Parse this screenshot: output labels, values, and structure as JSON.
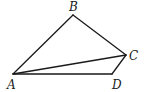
{
  "diagram": {
    "type": "geometry-figure",
    "stroke_color": "#1a1a1a",
    "points": {
      "A": {
        "label": "A",
        "x": 13,
        "y": 74,
        "label_x": 7,
        "label_y": 89
      },
      "B": {
        "label": "B",
        "x": 73,
        "y": 15,
        "label_x": 69,
        "label_y": 11
      },
      "C": {
        "label": "C",
        "x": 126,
        "y": 55,
        "label_x": 129,
        "label_y": 60
      },
      "D": {
        "label": "D",
        "x": 112,
        "y": 74,
        "label_x": 112,
        "label_y": 89
      }
    },
    "edges": [
      [
        "A",
        "B"
      ],
      [
        "B",
        "C"
      ],
      [
        "C",
        "D"
      ],
      [
        "D",
        "A"
      ],
      [
        "A",
        "C"
      ]
    ]
  }
}
